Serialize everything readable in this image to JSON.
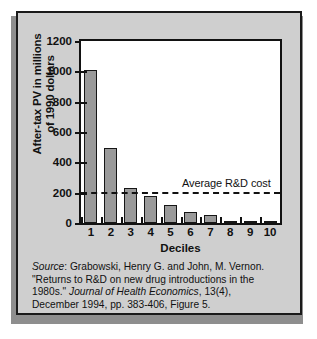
{
  "figure": {
    "background_color": "#cfcfcf",
    "plot_background_color": "#ffffff",
    "bar_color": "#9a9a9a",
    "border_color": "#121212"
  },
  "chart_data": {
    "type": "bar",
    "title": "",
    "xlabel": "Deciles",
    "ylabel": "After-tax PV in millions of 1990 dollars",
    "ylabel_line1": "After-tax PV in millions",
    "ylabel_line2": "of 1990 dollars",
    "categories": [
      "1",
      "2",
      "3",
      "4",
      "5",
      "6",
      "7",
      "8",
      "9",
      "10"
    ],
    "values": [
      1010,
      495,
      230,
      175,
      120,
      70,
      50,
      12,
      10,
      6
    ],
    "ylim": [
      0,
      1200
    ],
    "ytick_values": [
      0,
      200,
      400,
      600,
      800,
      1000,
      1200
    ],
    "ytick_labels": [
      "0",
      "200",
      "400",
      "600",
      "800",
      "1000",
      "1200"
    ],
    "grid": false,
    "legend": "none",
    "annotations": [
      {
        "label": "Average R&D cost",
        "type": "hline",
        "value": 205,
        "style": "dashed"
      }
    ]
  },
  "source": {
    "label": "Source",
    "line1_prefix": "Source",
    "line1_rest": ": Grabowski, Henry G. and John, M. Vernon.",
    "line2": "\"Returns to R&D on new drug introductions in the",
    "line3_prefix": "1980s.\" ",
    "line3_journal": "Journal of Health Economics",
    "line3_rest": ", 13(4),",
    "line4": "December 1994, pp. 383-406, Figure 5."
  }
}
